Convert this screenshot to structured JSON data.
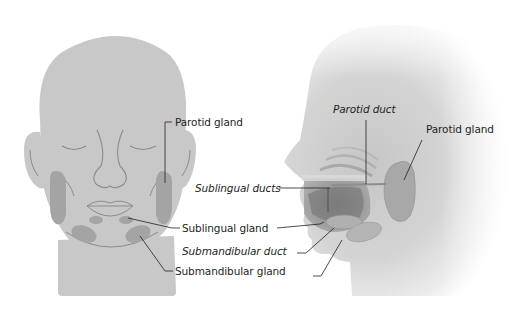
{
  "diagram": {
    "views": [
      {
        "id": "front",
        "name": "Front view of head"
      },
      {
        "id": "side",
        "name": "Side (profile) view of head"
      }
    ],
    "colors": {
      "background": "#ffffff",
      "head_fill": "#c8c8c8",
      "gland_fill": "#a4a4a4",
      "outline": "#8c8c8c",
      "leader_line": "#231f20",
      "text": "#231f20"
    },
    "labels": {
      "front_parotid_gland": "Parotid gland",
      "front_sublingual_gland": "Sublingual gland",
      "front_submandibular_gland": "Submandibular gland",
      "side_parotid_duct": "Parotid duct",
      "side_parotid_gland": "Parotid gland",
      "side_sublingual_ducts": "Sublingual ducts",
      "side_submandibular_duct": "Submandibular duct"
    },
    "label_styles": {
      "italic": [
        "Parotid duct",
        "Sublingual ducts",
        "Submandibular duct"
      ],
      "regular": [
        "Parotid gland",
        "Sublingual gland",
        "Submandibular gland"
      ]
    }
  }
}
